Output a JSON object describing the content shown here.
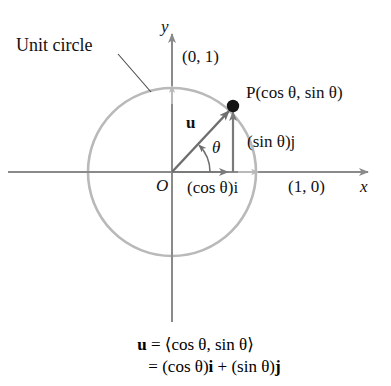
{
  "figure": {
    "type": "unit-circle-vector-diagram",
    "width": 391,
    "height": 386,
    "background": "#ffffff"
  },
  "labels": {
    "unit_circle": "Unit circle",
    "y_axis": "y",
    "x_axis": "x",
    "origin": "O",
    "coord_top": "(0, 1)",
    "coord_right": "(1, 0)",
    "point_P": "P(cos θ, sin θ)",
    "vector_u": "u",
    "angle_theta": "θ",
    "sin_component": "(sin θ)j",
    "cos_component": "(cos θ)i"
  },
  "caption": {
    "line1_lhs": "u",
    "line1_eq": " = ",
    "line1_rhs": "⟨cos θ, sin θ⟩",
    "line2_eq": "= ",
    "line2_rhs_a": "(cos θ)",
    "line2_i": "i",
    "line2_plus": " + ",
    "line2_rhs_b": "(sin θ)",
    "line2_j": "j"
  },
  "geometry": {
    "origin_x": 172,
    "origin_y": 172,
    "radius": 84,
    "point_P_x": 233,
    "point_P_y": 106,
    "theta_degrees": 45,
    "arc_radius": 38,
    "x_axis_start": 8,
    "x_axis_end": 372,
    "y_axis_top": 30,
    "y_axis_bottom": 322
  },
  "colors": {
    "circle_stroke": "#b9b9b9",
    "axis_stroke": "#8a8a8a",
    "vector_stroke": "#6e6e6e",
    "component_stroke": "#7a7a7a",
    "point_fill": "#141414",
    "leader_stroke": "#4a4a4a",
    "text": "#111111"
  }
}
